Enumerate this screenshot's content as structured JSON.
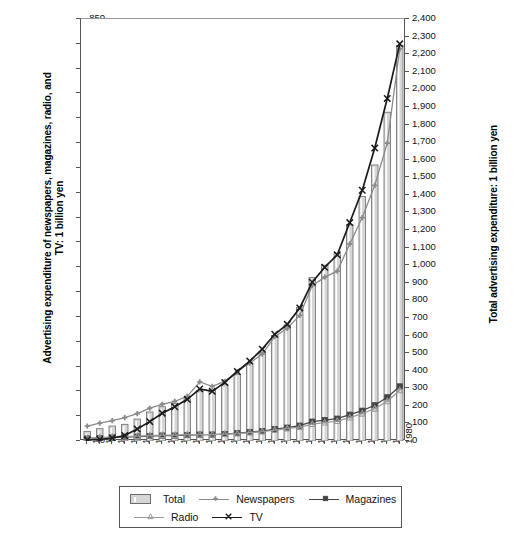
{
  "chart_data": {
    "type": "line",
    "title": "",
    "xlabel": "",
    "ylabel": "Advertising expenditure of newspapers, magazines, radio, and TV: 1 billion yen",
    "ylabel_right": "Total advertising expenditure: 1 billion yen",
    "grid": false,
    "legend_position": "bottom",
    "x": [
      1955,
      1956,
      1957,
      1958,
      1959,
      1960,
      1961,
      1962,
      1963,
      1964,
      1965,
      1966,
      1967,
      1968,
      1969,
      1970,
      1971,
      1972,
      1973,
      1974,
      1975,
      1976,
      1977,
      1978,
      1979,
      1980
    ],
    "xticklabels": [
      "1955",
      "1956",
      "1957",
      "1958",
      "1959",
      "1960",
      "1961",
      "1962",
      "1963",
      "1964",
      "1965",
      "1966",
      "1967",
      "1968",
      "1969",
      "1970",
      "1971",
      "1972",
      "1973",
      "1974",
      "1975",
      "1976",
      "1977",
      "1978",
      "1979",
      "1980"
    ],
    "ylim": [
      0,
      850
    ],
    "yticks": [
      0,
      50,
      100,
      150,
      200,
      250,
      300,
      350,
      400,
      450,
      500,
      550,
      600,
      650,
      700,
      750,
      800,
      850
    ],
    "yticklabels": [
      "0",
      "50",
      "100",
      "150",
      "200",
      "250",
      "300",
      "350",
      "400",
      "450",
      "500",
      "550",
      "600",
      "650",
      "700",
      "750",
      "800",
      "850"
    ],
    "ylim_right": [
      0,
      2400
    ],
    "yticks_right": [
      0,
      100,
      200,
      300,
      400,
      500,
      600,
      700,
      800,
      900,
      1000,
      1100,
      1200,
      1300,
      1400,
      1500,
      1600,
      1700,
      1800,
      1900,
      2000,
      2100,
      2200,
      2300,
      2400
    ],
    "yticklabels_right": [
      "0",
      "100",
      "200",
      "300",
      "400",
      "500",
      "600",
      "700",
      "800",
      "900",
      "1,000",
      "1,100",
      "1,200",
      "1,300",
      "1,400",
      "1,500",
      "1,600",
      "1,700",
      "1,800",
      "1,900",
      "2,000",
      "2,100",
      "2,200",
      "2,300",
      "2,400"
    ],
    "series": [
      {
        "name": "Total",
        "type": "bar",
        "axis": "right",
        "color": "#d6d6d6",
        "edge_color": "#6d6d6d",
        "marker": "bar",
        "values": [
          55,
          70,
          85,
          95,
          125,
          165,
          195,
          215,
          240,
          285,
          290,
          320,
          380,
          440,
          505,
          600,
          660,
          760,
          930,
          1000,
          1065,
          1230,
          1390,
          1570,
          1870,
          2250
        ]
      },
      {
        "name": "Newspapers",
        "type": "line",
        "axis": "left",
        "color": "#8a8a8a",
        "marker": "plus-diamond",
        "values": [
          30,
          36,
          41,
          47,
          55,
          66,
          74,
          80,
          90,
          119,
          110,
          120,
          140,
          157,
          175,
          210,
          227,
          253,
          313,
          330,
          342,
          397,
          450,
          515,
          600,
          790
        ]
      },
      {
        "name": "Magazines",
        "type": "line",
        "axis": "left",
        "color": "#444444",
        "marker": "square",
        "values": [
          5,
          6,
          7,
          8,
          9,
          10,
          11,
          11,
          12,
          13,
          13,
          14,
          16,
          18,
          20,
          24,
          27,
          31,
          39,
          42,
          45,
          53,
          61,
          72,
          88,
          110
        ]
      },
      {
        "name": "Radio",
        "type": "line",
        "axis": "left",
        "color": "#9a9a9a",
        "marker": "triangle",
        "values": [
          5,
          7,
          8,
          9,
          10,
          11,
          12,
          12,
          13,
          13,
          13,
          14,
          15,
          17,
          19,
          22,
          25,
          28,
          34,
          37,
          40,
          47,
          55,
          65,
          80,
          102
        ]
      },
      {
        "name": "TV",
        "type": "line",
        "axis": "left",
        "color": "#1a1a1a",
        "marker": "cross",
        "values": [
          2,
          3,
          6,
          11,
          24,
          39,
          56,
          69,
          84,
          105,
          100,
          118,
          140,
          161,
          185,
          215,
          235,
          268,
          320,
          350,
          375,
          440,
          505,
          590,
          690,
          800
        ]
      }
    ]
  },
  "legend": {
    "items": [
      {
        "label": "Total",
        "key": "bar"
      },
      {
        "label": "Newspapers",
        "key": "line-plus"
      },
      {
        "label": "Magazines",
        "key": "line-square"
      },
      {
        "label": "Radio",
        "key": "line-triangle"
      },
      {
        "label": "TV",
        "key": "line-cross"
      }
    ]
  },
  "axes": {
    "left_title": "Advertising expenditure of newspapers, magazines, radio, and TV: 1 billion yen",
    "right_title": "Total advertising expenditure: 1 billion yen"
  }
}
